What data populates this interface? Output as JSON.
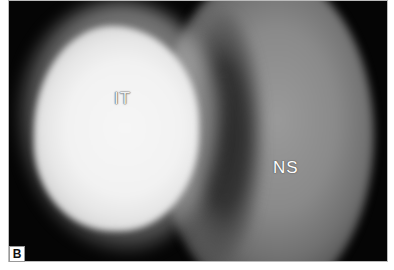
{
  "figure": {
    "panel_label": "B",
    "annotations": [
      {
        "id": "it",
        "text": "IT"
      },
      {
        "id": "ns",
        "text": "NS"
      }
    ]
  }
}
